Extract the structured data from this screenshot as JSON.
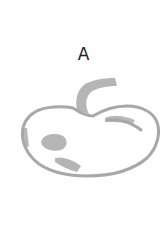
{
  "figure": {
    "label": "A",
    "drawing": {
      "subject": "apple-sketch",
      "stroke_color": "#a8a8a8"
    }
  }
}
